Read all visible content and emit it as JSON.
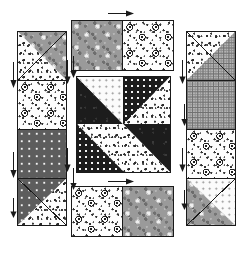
{
  "diagram": {
    "kind": "pinwheel-star block with pieced sashing strips",
    "background_color": "#ffffff",
    "outline_color": "#1a1a1a"
  },
  "fabrics": [
    {
      "key": "floral-white",
      "label": "white sprig floral print",
      "color": "#fdfdfd"
    },
    {
      "key": "floral-ring",
      "label": "white round-blossom floral print",
      "color": "#fdfdfd"
    },
    {
      "key": "grey-floral",
      "label": "medium grey mottled floral print",
      "color": "#9a9a9a"
    },
    {
      "key": "dark-solid",
      "label": "dark charcoal solid print",
      "color": "#1c1c1c"
    },
    {
      "key": "dark-dot",
      "label": "dark ground white polka dot",
      "color": "#1c1c1c"
    },
    {
      "key": "grey-dot",
      "label": "grey ground white pin dot",
      "color": "#5d5d5d"
    },
    {
      "key": "white-dot",
      "label": "white ground grey pin dot",
      "color": "#fbfbfb"
    },
    {
      "key": "grid-check",
      "label": "grey gingham check",
      "color": "#b4b4b4"
    }
  ],
  "center_block": {
    "name": "pinwheel star centre",
    "wedges": [
      {
        "position": "top-left-outer",
        "fabric": "dark-solid"
      },
      {
        "position": "top-left-inner",
        "fabric": "white-dot"
      },
      {
        "position": "top-right-inner",
        "fabric": "dark-dot"
      },
      {
        "position": "top-right-outer",
        "fabric": "floral-white"
      },
      {
        "position": "bottom-right-outer",
        "fabric": "dark-solid"
      },
      {
        "position": "bottom-right-inner",
        "fabric": "floral-white"
      },
      {
        "position": "bottom-left-inner",
        "fabric": "dark-dot"
      },
      {
        "position": "bottom-left-outer",
        "fabric": "floral-white"
      }
    ]
  },
  "strips": {
    "top": {
      "name": "top sashing strip",
      "orientation": "horizontal",
      "patches": [
        {
          "type": "square",
          "fabric": "grey-floral"
        },
        {
          "type": "square",
          "fabric": "floral-ring"
        }
      ]
    },
    "bottom": {
      "name": "bottom sashing strip",
      "orientation": "horizontal",
      "patches": [
        {
          "type": "square",
          "fabric": "floral-ring"
        },
        {
          "type": "square",
          "fabric": "grey-floral"
        }
      ]
    },
    "left": {
      "name": "left sashing strip",
      "orientation": "vertical",
      "patches": [
        {
          "type": "half-square-triangle",
          "fabric_a": "grey-floral",
          "fabric_b": "floral-white",
          "diagonal": "top-left-to-bottom-right"
        },
        {
          "type": "square",
          "fabric": "floral-ring"
        },
        {
          "type": "square",
          "fabric": "grey-dot"
        },
        {
          "type": "half-square-triangle",
          "fabric_a": "grey-dot",
          "fabric_b": "floral-white",
          "diagonal": "top-right-to-bottom-left"
        }
      ]
    },
    "right": {
      "name": "right sashing strip",
      "orientation": "vertical",
      "patches": [
        {
          "type": "half-square-triangle",
          "fabric_a": "floral-white",
          "fabric_b": "grid-check",
          "diagonal": "top-left-to-bottom-right"
        },
        {
          "type": "square",
          "fabric": "grid-check"
        },
        {
          "type": "square",
          "fabric": "floral-ring"
        },
        {
          "type": "half-square-triangle",
          "fabric_a": "white-dot",
          "fabric_b": "grey-floral",
          "diagonal": "top-left-to-bottom-right"
        }
      ]
    }
  },
  "arrows": [
    {
      "name": "top-strip-pressing-arrow",
      "direction": "right",
      "note": "press seam toward the right"
    },
    {
      "name": "bottom-strip-pressing-arrow",
      "direction": "right",
      "note": "press seam toward the right"
    },
    {
      "name": "left-strip-arrow-upper",
      "direction": "down"
    },
    {
      "name": "left-strip-arrow-lower",
      "direction": "down"
    },
    {
      "name": "left-strip-arrow-bottom",
      "direction": "down"
    },
    {
      "name": "left-outer-arrow-upper",
      "direction": "down"
    },
    {
      "name": "left-outer-arrow-lower",
      "direction": "down"
    },
    {
      "name": "centre-left-arrow-top",
      "direction": "down"
    },
    {
      "name": "centre-left-arrow-bottom",
      "direction": "down"
    },
    {
      "name": "right-strip-arrow-upper",
      "direction": "down"
    },
    {
      "name": "right-strip-arrow-lower",
      "direction": "down"
    },
    {
      "name": "right-outer-arrow-upper",
      "direction": "down"
    },
    {
      "name": "right-outer-arrow-lower",
      "direction": "down"
    }
  ]
}
